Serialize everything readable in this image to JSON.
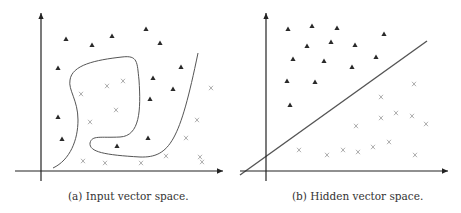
{
  "figure": {
    "panels": [
      {
        "id": "a",
        "caption": "(a) Input vector space.",
        "x_axis": {
          "x1": 15,
          "x2": 223,
          "y": 171
        },
        "y_axis": {
          "x": 41,
          "y1": 13,
          "y2": 181
        },
        "triangles": [
          [
            66,
            39
          ],
          [
            92,
            45
          ],
          [
            112,
            36
          ],
          [
            146,
            29
          ],
          [
            160,
            43
          ],
          [
            58,
            68
          ],
          [
            153,
            78
          ],
          [
            181,
            67
          ],
          [
            173,
            89
          ],
          [
            150,
            99
          ],
          [
            58,
            117
          ],
          [
            62,
            139
          ],
          [
            148,
            138
          ],
          [
            117,
            146
          ]
        ],
        "crosses": [
          [
            123,
            81
          ],
          [
            107,
            86
          ],
          [
            81,
            94
          ],
          [
            116,
            110
          ],
          [
            90,
            122
          ],
          [
            211,
            88
          ],
          [
            197,
            120
          ],
          [
            186,
            138
          ],
          [
            200,
            157
          ],
          [
            166,
            156
          ],
          [
            202,
            162
          ],
          [
            83,
            161
          ],
          [
            105,
            163
          ],
          [
            141,
            163
          ]
        ],
        "boundaries": [
          "M 53 168 C 70 160, 78 140, 78 120 C 78 100, 68 90, 70 80 C 72 65, 95 60, 122 57 C 138 55, 137 62, 139 80 C 141 110, 140 136, 120 137 C 100 138, 92 135, 90 143 C 89 152, 105 155, 140 157 C 170 158, 180 140, 198 53"
        ]
      },
      {
        "id": "b",
        "caption": "(b) Hidden vector space.",
        "x_axis": {
          "x1": 240,
          "x2": 448,
          "y": 171
        },
        "y_axis": {
          "x": 266,
          "y1": 13,
          "y2": 181
        },
        "triangles": [
          [
            288,
            29
          ],
          [
            312,
            26
          ],
          [
            337,
            28
          ],
          [
            384,
            34
          ],
          [
            307,
            46
          ],
          [
            331,
            42
          ],
          [
            355,
            45
          ],
          [
            293,
            59
          ],
          [
            324,
            61
          ],
          [
            352,
            67
          ],
          [
            376,
            57
          ],
          [
            287,
            81
          ],
          [
            315,
            82
          ],
          [
            290,
            105
          ]
        ],
        "crosses": [
          [
            414,
            84
          ],
          [
            381,
            97
          ],
          [
            381,
            118
          ],
          [
            396,
            113
          ],
          [
            412,
            116
          ],
          [
            426,
            124
          ],
          [
            356,
            126
          ],
          [
            299,
            150
          ],
          [
            327,
            155
          ],
          [
            343,
            150
          ],
          [
            358,
            152
          ],
          [
            373,
            147
          ],
          [
            389,
            142
          ],
          [
            415,
            155
          ]
        ],
        "boundaries": [
          "M 240 175 L 427 41"
        ]
      }
    ],
    "colors": {
      "axis": "#222222",
      "boundary": "#555555",
      "triangle": "#2a2a2a",
      "cross": "#999999"
    }
  }
}
